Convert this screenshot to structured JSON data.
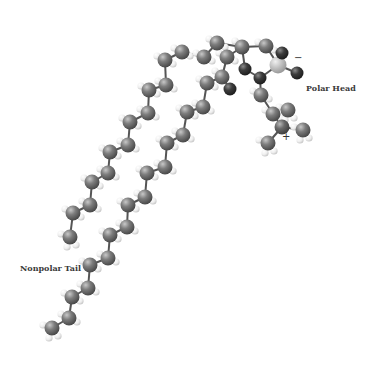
{
  "labels": {
    "polar_head": "Polar Head",
    "nonpolar_tail": "Nonpolar Tail",
    "negative_charge": "−",
    "positive_charge": "+"
  },
  "colors": {
    "carbon": "#777777",
    "oxygen": "#3c3c3c",
    "phosphorus": "#c4c4c4",
    "nitrogen": "#6a6a6a",
    "hydrogen": "#eeeeee",
    "bond": "#555555"
  },
  "molecule": {
    "name": "phospholipid",
    "atoms": [
      {
        "id": "a1",
        "el": "C",
        "x": 70,
        "y": 237
      },
      {
        "id": "a2",
        "el": "C",
        "x": 73,
        "y": 213
      },
      {
        "id": "a3",
        "el": "C",
        "x": 90,
        "y": 205
      },
      {
        "id": "a4",
        "el": "C",
        "x": 92,
        "y": 182
      },
      {
        "id": "a5",
        "el": "C",
        "x": 108,
        "y": 173
      },
      {
        "id": "a6",
        "el": "C",
        "x": 110,
        "y": 152
      },
      {
        "id": "a7",
        "el": "C",
        "x": 128,
        "y": 145
      },
      {
        "id": "a8",
        "el": "C",
        "x": 130,
        "y": 122
      },
      {
        "id": "a9",
        "el": "C",
        "x": 148,
        "y": 113
      },
      {
        "id": "a10",
        "el": "C",
        "x": 149,
        "y": 90
      },
      {
        "id": "a11",
        "el": "C",
        "x": 166,
        "y": 85
      },
      {
        "id": "a12",
        "el": "C",
        "x": 165,
        "y": 60
      },
      {
        "id": "a13",
        "el": "C",
        "x": 182,
        "y": 52
      },
      {
        "id": "a14",
        "el": "C",
        "x": 204,
        "y": 57
      },
      {
        "id": "a15",
        "el": "C",
        "x": 217,
        "y": 43
      },
      {
        "id": "a16",
        "el": "C",
        "x": 242,
        "y": 47
      },
      {
        "id": "a17",
        "el": "C",
        "x": 227,
        "y": 57
      },
      {
        "id": "a18",
        "el": "O",
        "x": 245,
        "y": 69
      },
      {
        "id": "a19",
        "el": "C",
        "x": 266,
        "y": 46
      },
      {
        "id": "a20",
        "el": "O",
        "x": 260,
        "y": 78
      },
      {
        "id": "a21",
        "el": "P",
        "x": 278,
        "y": 65
      },
      {
        "id": "a22",
        "el": "O",
        "x": 282,
        "y": 53
      },
      {
        "id": "a23",
        "el": "O",
        "x": 297,
        "y": 73
      },
      {
        "id": "a24",
        "el": "C",
        "x": 261,
        "y": 95
      },
      {
        "id": "a25",
        "el": "C",
        "x": 273,
        "y": 114
      },
      {
        "id": "a26",
        "el": "N",
        "x": 282,
        "y": 127
      },
      {
        "id": "a27",
        "el": "C",
        "x": 303,
        "y": 130
      },
      {
        "id": "a28",
        "el": "C",
        "x": 268,
        "y": 143
      },
      {
        "id": "a29",
        "el": "C",
        "x": 288,
        "y": 110
      },
      {
        "id": "b1",
        "el": "C",
        "x": 222,
        "y": 77
      },
      {
        "id": "b2",
        "el": "O",
        "x": 230,
        "y": 89
      },
      {
        "id": "b3",
        "el": "C",
        "x": 207,
        "y": 83
      },
      {
        "id": "b4",
        "el": "C",
        "x": 203,
        "y": 107
      },
      {
        "id": "b5",
        "el": "C",
        "x": 187,
        "y": 112
      },
      {
        "id": "b6",
        "el": "C",
        "x": 183,
        "y": 135
      },
      {
        "id": "b7",
        "el": "C",
        "x": 167,
        "y": 143
      },
      {
        "id": "b8",
        "el": "C",
        "x": 165,
        "y": 167
      },
      {
        "id": "b9",
        "el": "C",
        "x": 147,
        "y": 173
      },
      {
        "id": "b10",
        "el": "C",
        "x": 145,
        "y": 197
      },
      {
        "id": "b11",
        "el": "C",
        "x": 128,
        "y": 205
      },
      {
        "id": "b12",
        "el": "C",
        "x": 127,
        "y": 227
      },
      {
        "id": "b13",
        "el": "C",
        "x": 110,
        "y": 235
      },
      {
        "id": "b14",
        "el": "C",
        "x": 108,
        "y": 258
      },
      {
        "id": "b15",
        "el": "C",
        "x": 90,
        "y": 265
      },
      {
        "id": "b16",
        "el": "C",
        "x": 88,
        "y": 288
      },
      {
        "id": "b17",
        "el": "C",
        "x": 72,
        "y": 297
      },
      {
        "id": "b18",
        "el": "C",
        "x": 69,
        "y": 318
      },
      {
        "id": "b19",
        "el": "C",
        "x": 52,
        "y": 328
      }
    ],
    "bonds": [
      [
        "a1",
        "a2"
      ],
      [
        "a2",
        "a3"
      ],
      [
        "a3",
        "a4"
      ],
      [
        "a4",
        "a5"
      ],
      [
        "a5",
        "a6"
      ],
      [
        "a6",
        "a7"
      ],
      [
        "a7",
        "a8"
      ],
      [
        "a8",
        "a9"
      ],
      [
        "a9",
        "a10"
      ],
      [
        "a10",
        "a11"
      ],
      [
        "a11",
        "a12"
      ],
      [
        "a12",
        "a13"
      ],
      [
        "a13",
        "a14"
      ],
      [
        "a14",
        "a15"
      ],
      [
        "a15",
        "a16"
      ],
      [
        "a16",
        "a19"
      ],
      [
        "a16",
        "a17"
      ],
      [
        "a16",
        "a18"
      ],
      [
        "a17",
        "b1"
      ],
      [
        "a19",
        "a21"
      ],
      [
        "a18",
        "a20"
      ],
      [
        "a20",
        "a21"
      ],
      [
        "a21",
        "a22"
      ],
      [
        "a21",
        "a23"
      ],
      [
        "a20",
        "a24"
      ],
      [
        "a24",
        "a25"
      ],
      [
        "a25",
        "a26"
      ],
      [
        "a26",
        "a27"
      ],
      [
        "a26",
        "a28"
      ],
      [
        "a26",
        "a29"
      ],
      [
        "b1",
        "b2"
      ],
      [
        "b1",
        "b3"
      ],
      [
        "b3",
        "b4"
      ],
      [
        "b4",
        "b5"
      ],
      [
        "b5",
        "b6"
      ],
      [
        "b6",
        "b7"
      ],
      [
        "b7",
        "b8"
      ],
      [
        "b8",
        "b9"
      ],
      [
        "b9",
        "b10"
      ],
      [
        "b10",
        "b11"
      ],
      [
        "b11",
        "b12"
      ],
      [
        "b12",
        "b13"
      ],
      [
        "b13",
        "b14"
      ],
      [
        "b14",
        "b15"
      ],
      [
        "b15",
        "b16"
      ],
      [
        "b16",
        "b17"
      ],
      [
        "b17",
        "b18"
      ],
      [
        "b18",
        "b19"
      ]
    ]
  }
}
